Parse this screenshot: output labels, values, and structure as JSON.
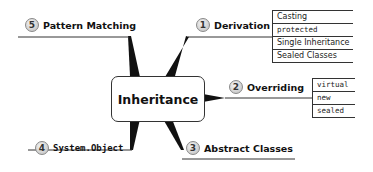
{
  "diagram": {
    "central": {
      "label": "Inheritance"
    },
    "branches": [
      {
        "number": "1",
        "label": "Derivation",
        "children": [
          "Casting",
          "protected",
          "Single Inheritance",
          "Sealed Classes"
        ]
      },
      {
        "number": "2",
        "label": "Overriding",
        "children": [
          "virtual",
          "new",
          "sealed"
        ]
      },
      {
        "number": "3",
        "label": "Abstract Classes",
        "children": []
      },
      {
        "number": "4",
        "label": "System.Object",
        "children": []
      },
      {
        "number": "5",
        "label": "Pattern Matching",
        "children": []
      }
    ]
  }
}
